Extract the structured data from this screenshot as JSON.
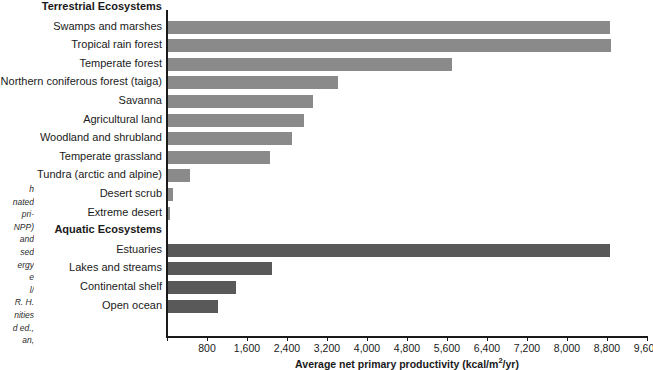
{
  "figure": {
    "caption_fragment_lines": [
      "h",
      "nated",
      "pri-",
      "NPP)",
      "and",
      "sed",
      "ergy",
      "e",
      "l/",
      "R. H.",
      "nities",
      "d ed.,",
      "an,"
    ]
  },
  "chart_data": {
    "type": "bar",
    "orientation": "horizontal",
    "title": "",
    "xlabel": "Average net primary productivity (kcal/m2/yr)",
    "xlabel_display": "Average net primary productivity (kcal/m",
    "xlabel_sup": "2",
    "xlabel_tail": "/yr)",
    "ylabel": "",
    "xlim": [
      0,
      9600
    ],
    "xticks": [
      0,
      800,
      1600,
      2400,
      3200,
      4000,
      4800,
      5600,
      6400,
      7200,
      8000,
      8800,
      9600
    ],
    "xtick_labels": [
      "",
      "800",
      "1,600",
      "2,400",
      "3,200",
      "4,000",
      "4,800",
      "5,600",
      "6,400",
      "7,200",
      "8,000",
      "8,800",
      "9,600"
    ],
    "grid": false,
    "legend": "none",
    "colors": {
      "terrestrial_bar": "#8a8a8a",
      "aquatic_bar": "#595959",
      "axis": "#1a1a1a",
      "background": "#ffffff"
    },
    "groups": [
      {
        "name": "Terrestrial Ecosystems",
        "series_name": "terrestrial",
        "color": "#8a8a8a",
        "categories": [
          "Swamps and marshes",
          "Tropical rain forest",
          "Temperate forest",
          "Northern coniferous forest (taiga)",
          "Savanna",
          "Agricultural land",
          "Woodland and shrubland",
          "Temperate grassland",
          "Tundra (arctic and alpine)",
          "Desert scrub",
          "Extreme desert"
        ],
        "values": [
          8860,
          8880,
          5700,
          3420,
          2920,
          2740,
          2500,
          2060,
          460,
          120,
          60
        ]
      },
      {
        "name": "Aquatic Ecosystems",
        "series_name": "aquatic",
        "color": "#595959",
        "categories": [
          "Estuaries",
          "Lakes and streams",
          "Continental shelf",
          "Open ocean"
        ],
        "values": [
          8860,
          2100,
          1380,
          1020
        ]
      }
    ]
  }
}
